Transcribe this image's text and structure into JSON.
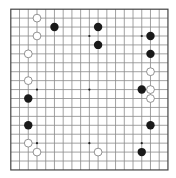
{
  "board": {
    "size": 19,
    "origin_x": 10.8,
    "origin_y": 9.2,
    "spacing_x": 8.73,
    "spacing_y": 8.93,
    "stone_radius": 4.2,
    "colors": {
      "background": "#ffffff",
      "grid_line": "#8a8a8a",
      "border_line": "#444444",
      "star_point": "#222222",
      "black_stone": "#1a1a1a",
      "white_stone_fill": "#ffffff",
      "white_stone_stroke": "#777777"
    },
    "star_points": [
      [
        3,
        3
      ],
      [
        9,
        3
      ],
      [
        15,
        3
      ],
      [
        3,
        9
      ],
      [
        9,
        9
      ],
      [
        15,
        9
      ],
      [
        3,
        15
      ],
      [
        9,
        15
      ],
      [
        15,
        15
      ]
    ],
    "stones": {
      "black": [
        [
          5,
          2
        ],
        [
          10,
          2
        ],
        [
          10,
          4
        ],
        [
          16,
          3
        ],
        [
          16,
          5
        ],
        [
          15,
          9
        ],
        [
          2,
          10
        ],
        [
          2,
          13
        ],
        [
          16,
          13
        ],
        [
          15,
          16
        ]
      ],
      "white": [
        [
          3,
          1
        ],
        [
          3,
          3
        ],
        [
          2,
          5
        ],
        [
          2,
          8
        ],
        [
          2,
          15
        ],
        [
          3,
          16
        ],
        [
          10,
          16
        ],
        [
          16,
          7
        ],
        [
          16,
          9
        ],
        [
          16,
          10
        ]
      ]
    }
  }
}
